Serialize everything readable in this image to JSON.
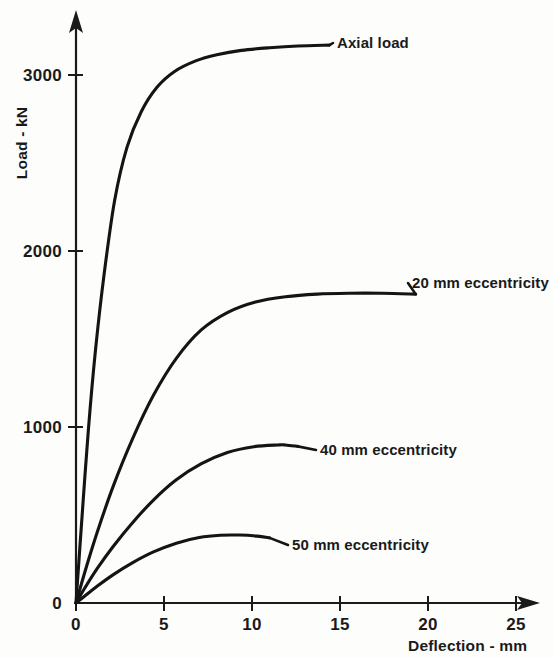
{
  "chart_data": {
    "type": "line",
    "title": "",
    "xlabel": "Deflection - mm",
    "ylabel": "Load - kN",
    "xlim": [
      0,
      27
    ],
    "ylim": [
      0,
      3400
    ],
    "xticks": [
      0,
      5,
      10,
      15,
      20,
      25
    ],
    "xticklabels": [
      "0",
      "5",
      "10",
      "15",
      "20",
      "25"
    ],
    "yticks": [
      0,
      1000,
      2000,
      3000
    ],
    "yticklabels": [
      "0",
      "1000",
      "2000",
      "3000"
    ],
    "grid": false,
    "legend_position": "inline-annotations",
    "series": [
      {
        "name": "Axial load",
        "label": "Axial load",
        "x": [
          0,
          0.3,
          0.7,
          1.1,
          1.6,
          2.2,
          2.9,
          3.7,
          4.6,
          5.6,
          6.8,
          8.0,
          9.4,
          11.0,
          12.6,
          14.4
        ],
        "y": [
          0,
          430,
          980,
          1430,
          1870,
          2290,
          2590,
          2790,
          2930,
          3020,
          3080,
          3115,
          3140,
          3155,
          3165,
          3170
        ]
      },
      {
        "name": "20 mm eccentricity",
        "label": "20 mm eccentricity",
        "x": [
          0,
          0.5,
          1.2,
          2.1,
          3.2,
          4.4,
          5.7,
          7.1,
          8.6,
          10.2,
          11.9,
          13.7,
          15.5,
          17.4,
          19.3
        ],
        "y": [
          0,
          175,
          400,
          660,
          930,
          1180,
          1390,
          1550,
          1650,
          1710,
          1740,
          1755,
          1760,
          1760,
          1755
        ]
      },
      {
        "name": "40 mm eccentricity",
        "label": "40 mm eccentricity",
        "x": [
          0,
          0.5,
          1.2,
          2.1,
          3.2,
          4.4,
          5.7,
          7.1,
          8.6,
          10.1,
          11.5,
          11.9,
          12.6
        ],
        "y": [
          0,
          85,
          195,
          320,
          455,
          585,
          700,
          790,
          855,
          888,
          898,
          898,
          890
        ]
      },
      {
        "name": "50 mm eccentricity",
        "label": "50 mm eccentricity",
        "x": [
          0,
          0.5,
          1.2,
          2.1,
          3.2,
          4.4,
          5.7,
          7.0,
          8.2,
          9.3,
          10.3,
          11.0
        ],
        "y": [
          0,
          40,
          95,
          160,
          228,
          290,
          340,
          372,
          385,
          386,
          380,
          370
        ]
      }
    ],
    "annotations": [
      {
        "text": "Axial load",
        "data_x": 14.4,
        "data_y": 3170
      },
      {
        "text": "20 mm eccentricity",
        "data_x": 19.3,
        "data_y": 1755
      },
      {
        "text": "40 mm eccentricity",
        "data_x": 12.6,
        "data_y": 890
      },
      {
        "text": "50 mm eccentricity",
        "data_x": 11.0,
        "data_y": 370
      }
    ],
    "colors": {
      "curve": "#141414",
      "axis": "#1a1a1a",
      "background": "#fdfdfc"
    }
  }
}
